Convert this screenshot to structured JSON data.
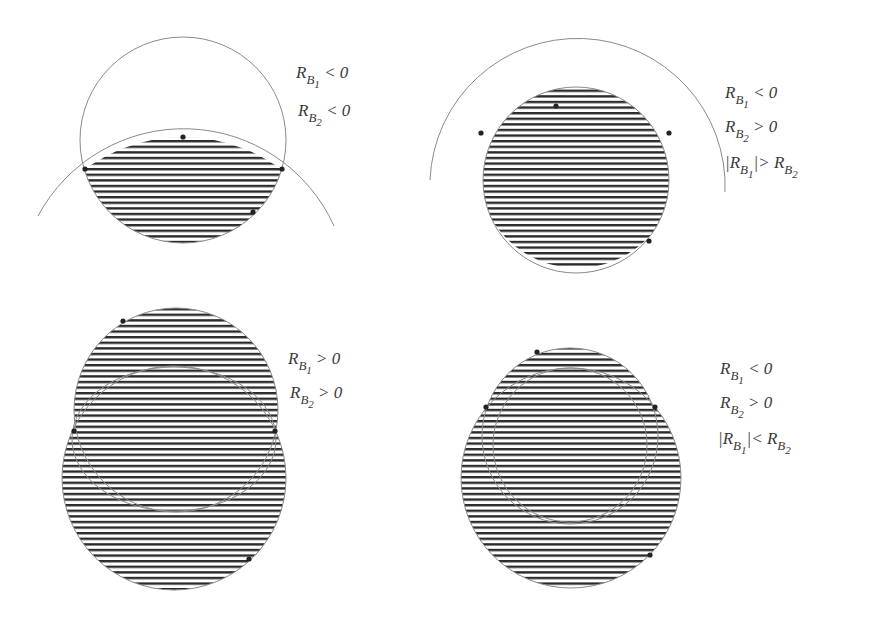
{
  "colors": {
    "background": "#ffffff",
    "stroke": "#8a8a8a",
    "hatch": "#2b2b2b",
    "dot": "#222222",
    "text": "#3a3a3a"
  },
  "panels": [
    {
      "id": "top-left",
      "description": "Intersection lens of two circles; both radii negative",
      "conditions": [
        {
          "R": "R",
          "sub": "B",
          "subsub": "1",
          "rel": "< 0"
        },
        {
          "R": "R",
          "sub": "B",
          "subsub": "2",
          "rel": "< 0"
        }
      ]
    },
    {
      "id": "top-right",
      "description": "Circle cut by a larger arc; |R_B1| greater than R_B2",
      "conditions": [
        {
          "R": "R",
          "sub": "B",
          "subsub": "1",
          "rel": "< 0"
        },
        {
          "R": "R",
          "sub": "B",
          "subsub": "2",
          "rel": "> 0"
        }
      ],
      "extra": {
        "left": "|R",
        "lsub": "B",
        "lsubsub": "1",
        "mid": "|>  R",
        "rsub": "B",
        "rsubsub": "2"
      }
    },
    {
      "id": "bottom-left",
      "description": "Union of two circles; both radii positive",
      "conditions": [
        {
          "R": "R",
          "sub": "B",
          "subsub": "1",
          "rel": "> 0"
        },
        {
          "R": "R",
          "sub": "B",
          "subsub": "2",
          "rel": "> 0"
        }
      ]
    },
    {
      "id": "bottom-right",
      "description": "Union of two circles; |R_B1| less than R_B2",
      "conditions": [
        {
          "R": "R",
          "sub": "B",
          "subsub": "1",
          "rel": "< 0"
        },
        {
          "R": "R",
          "sub": "B",
          "subsub": "2",
          "rel": "> 0"
        }
      ],
      "extra": {
        "left": "|R",
        "lsub": "B",
        "lsubsub": "1",
        "mid": "|<  R",
        "rsub": "B",
        "rsubsub": "2"
      }
    }
  ]
}
